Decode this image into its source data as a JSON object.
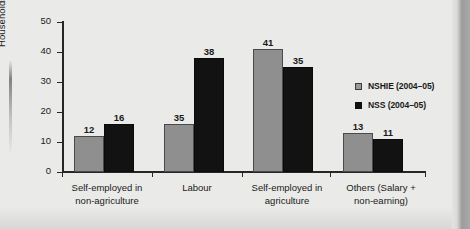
{
  "chart_data": {
    "type": "bar",
    "title": "",
    "xlabel": "",
    "ylabel": "Households (%)",
    "ylim": [
      0,
      50
    ],
    "yticks": [
      0,
      10,
      20,
      30,
      40,
      50
    ],
    "grid": false,
    "legend_position": "right",
    "categories": [
      "Self-employed in non-agriculture",
      "Labour",
      "Self-employed in agriculture",
      "Others (Salary + non-earning)"
    ],
    "category_lines": [
      [
        "Self-employed in",
        "non-agriculture"
      ],
      [
        "Labour",
        ""
      ],
      [
        "Self-employed in",
        "agriculture"
      ],
      [
        "Others (Salary +",
        "non-earning)"
      ]
    ],
    "series": [
      {
        "name": "NSHIE (2004–05)",
        "color": "#8f8f8f",
        "values": [
          12,
          16,
          41,
          13
        ],
        "value_labels": [
          "12",
          "35",
          "41",
          "13"
        ]
      },
      {
        "name": "NSS (2004–05)",
        "color": "#121212",
        "values": [
          16,
          38,
          35,
          11
        ],
        "value_labels": [
          "16",
          "38",
          "35",
          "11"
        ]
      }
    ],
    "bars": [
      {
        "group": 0,
        "series": "NSHIE (2004–05)",
        "value": 12,
        "label": "12"
      },
      {
        "group": 0,
        "series": "NSS (2004–05)",
        "value": 16,
        "label": "16"
      },
      {
        "group": 1,
        "series": "NSHIE (2004–05)",
        "value": 35,
        "label": "35"
      },
      {
        "group": 1,
        "series": "NSS (2004–05)",
        "value": 38,
        "label": "38"
      },
      {
        "group": 2,
        "series": "NSHIE (2004–05)",
        "value": 41,
        "label": "41"
      },
      {
        "group": 2,
        "series": "NSS (2004–05)",
        "value": 35,
        "label": "35"
      },
      {
        "group": 3,
        "series": "NSHIE (2004–05)",
        "value": 13,
        "label": "13"
      },
      {
        "group": 3,
        "series": "NSS (2004–05)",
        "value": 11,
        "label": "11"
      }
    ],
    "legend": [
      {
        "label": "NSHIE (2004–05)",
        "color": "#9a9a9a"
      },
      {
        "label": "NSS (2004–05)",
        "color": "#101010"
      }
    ],
    "ytick_labels": [
      "0",
      "10",
      "20",
      "30",
      "40",
      "50"
    ]
  }
}
